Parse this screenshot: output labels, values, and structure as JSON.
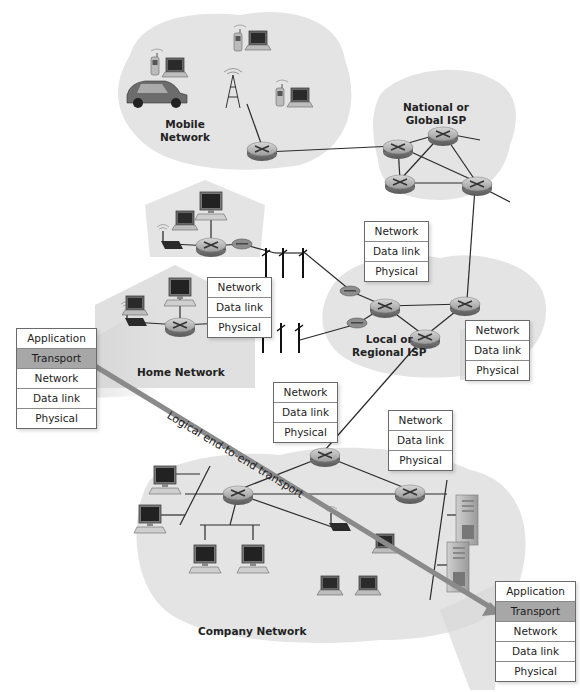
{
  "regions": {
    "mobile": {
      "label_line1": "Mobile",
      "label_line2": "Network"
    },
    "global_isp": {
      "label_line1": "National or",
      "label_line2": "Global ISP"
    },
    "regional_isp": {
      "label_line1": "Local or",
      "label_line2": "Regional ISP"
    },
    "home": {
      "label": "Home Network"
    },
    "company": {
      "label": "Company Network"
    }
  },
  "stacks": {
    "host_left": [
      "Application",
      "Transport",
      "Network",
      "Data link",
      "Physical"
    ],
    "host_right": [
      "Application",
      "Transport",
      "Network",
      "Data link",
      "Physical"
    ],
    "router_home": [
      "Network",
      "Data link",
      "Physical"
    ],
    "router_regional_top": [
      "Network",
      "Data link",
      "Physical"
    ],
    "router_regional_right": [
      "Network",
      "Data link",
      "Physical"
    ],
    "router_company_top": [
      "Network",
      "Data link",
      "Physical"
    ],
    "router_company_right": [
      "Network",
      "Data link",
      "Physical"
    ]
  },
  "highlighted_layer": "Transport",
  "arrow": {
    "label": "Logical end-to-end transport",
    "color": "#8a8a8a"
  },
  "colors": {
    "cloud": "#e4e4e4",
    "highlight": "#a7a7a7",
    "line": "#2a2a2a"
  },
  "icons": [
    "router-icon",
    "laptop-icon",
    "desktop-icon",
    "cell-phone-icon",
    "car-icon",
    "cell-tower-icon",
    "wireless-access-point-icon",
    "modem-icon",
    "telephone-pole-icon",
    "server-icon"
  ]
}
